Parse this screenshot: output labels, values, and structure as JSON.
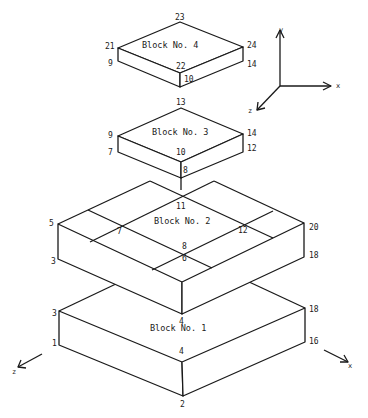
{
  "figure": {
    "blocks": [
      {
        "label": "Block No. 4",
        "node_labels": {
          "left_top": "21",
          "back_top": "23",
          "right_top": "24",
          "front_top": "22",
          "left_bottom": "9",
          "right_bottom": "14",
          "front_bottom": "10"
        }
      },
      {
        "label": "Block No. 3",
        "node_labels": {
          "left_top": "9",
          "back_top": "13",
          "right_top": "14",
          "front_top": "10",
          "left_bottom": "7",
          "right_bottom": "12",
          "front_bottom": "8"
        }
      },
      {
        "label": "Block No. 2",
        "node_labels": {
          "left_top": "5",
          "right_top": "20",
          "left_bottom": "3",
          "right_bottom": "18",
          "front_bottom": "4",
          "inner_back": "11",
          "inner_left": "7",
          "inner_right": "12",
          "inner_front_top": "8",
          "inner_front_bottom": "6"
        }
      },
      {
        "label": "Block No. 1",
        "node_labels": {
          "left_top": "3",
          "right_top": "18",
          "back_top": "4",
          "front_top": "4",
          "left_bottom": "1",
          "right_bottom": "16",
          "front_bottom": "2"
        }
      }
    ],
    "axes_top": {
      "y": "y",
      "x": "x",
      "z": "z"
    },
    "axes_bottom": {
      "z": "z",
      "x": "x"
    },
    "colors": {
      "line": "#1a1a1a",
      "background": "#ffffff"
    }
  }
}
